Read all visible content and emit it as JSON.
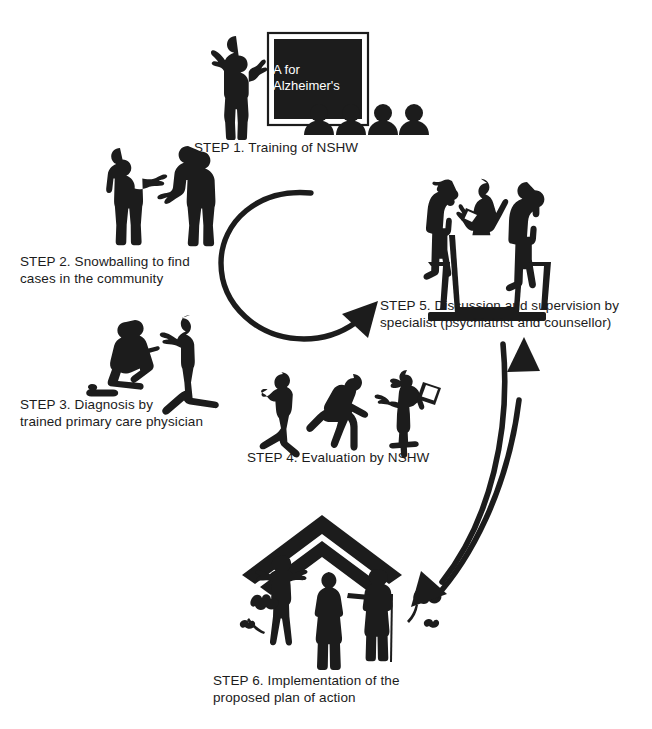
{
  "diagram": {
    "background_color": "#ffffff",
    "silhouette_color": "#1c1c1c",
    "board": {
      "text": "A for\nAlzheimer's",
      "text_color": "#ffffff",
      "board_color": "#1c1c1c",
      "frame_color": "#ffffff"
    },
    "steps": [
      {
        "id": "step1",
        "label": "STEP 1. Training of NSHW",
        "scene": "trainer-with-blackboard-and-audience",
        "audience_count": 4
      },
      {
        "id": "step2",
        "label": "STEP 2. Snowballing to find\ncases in the community",
        "scene": "two-people-talking-standing"
      },
      {
        "id": "step3",
        "label": "STEP 3. Diagnosis by\ntrained primary care physician",
        "scene": "two-people-seated-on-ground-consulting"
      },
      {
        "id": "step4",
        "label": "STEP 4. Evaluation by NSHW",
        "scene": "three-figures-distressed-and-health-worker-with-clipboard"
      },
      {
        "id": "step5",
        "label": "STEP 5. Discussion and supervision by\nspecialist (psychiatrist and counsellor)",
        "scene": "three-people-at-table-meeting"
      },
      {
        "id": "step6",
        "label": "STEP 6. Implementation of the\nproposed plan of action",
        "scene": "family-under-roof-with-elderly-couple-and-plants"
      }
    ],
    "arrows": [
      {
        "id": "cycle-arrow",
        "name": "central-circular-arrow",
        "description": "large open circular arrow in centre pointing up-right toward STEP 5",
        "direction": "counter-clockwise-to-step5"
      },
      {
        "id": "arrow-up-to-step5",
        "name": "curved-arrow-up",
        "description": "curved arrow from STEP 6 area up to STEP 5",
        "direction": "up"
      },
      {
        "id": "arrow-down-to-step6",
        "name": "curved-arrow-down",
        "description": "curved arrow from STEP 5 down-left to STEP 6",
        "direction": "down-left"
      }
    ]
  }
}
